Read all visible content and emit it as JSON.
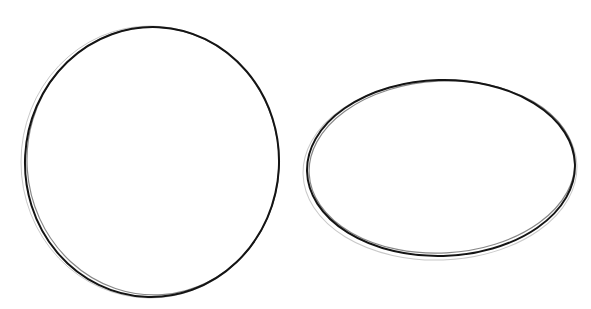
{
  "drawing": {
    "title": "Pencil sketch of a circle and an ellipse",
    "medium": "pencil",
    "stroke_color": "#141414",
    "background_color": "#ffffff",
    "shapes": [
      {
        "name": "circle",
        "kind": "circle"
      },
      {
        "name": "ellipse",
        "kind": "ellipse",
        "orientation": "horizontal"
      }
    ]
  }
}
